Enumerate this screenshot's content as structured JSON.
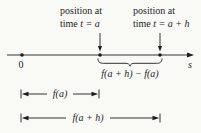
{
  "colors": {
    "ink": "#1d1d1d",
    "background": "#f9f9f6"
  },
  "annotations": {
    "position_a": {
      "line1": "position at",
      "line2_plain": "time ",
      "line2_math": "t = a"
    },
    "position_ah": {
      "line1": "position at",
      "line2_plain": "time ",
      "line2_math": "t = a + h"
    }
  },
  "axis": {
    "origin_label": "0",
    "axis_label": "s"
  },
  "measurements": {
    "difference_label": "f(a + h) − f(a)",
    "fa_label": "f(a)",
    "fah_label": "f(a + h)"
  }
}
